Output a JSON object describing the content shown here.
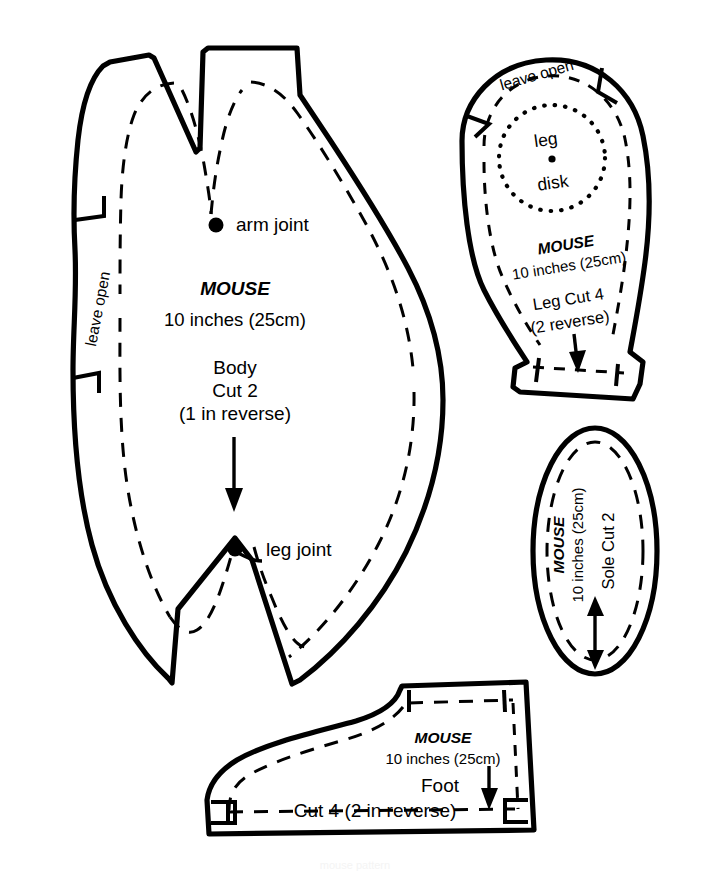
{
  "document": {
    "title": "MOUSE sewing pattern sheet",
    "brand": "MOUSE",
    "size": "10 inches (25cm)",
    "watermark": "mouse pattern"
  },
  "pieces": [
    {
      "id": "body",
      "name": "Body",
      "brand": "MOUSE",
      "size": "10 inches (25cm)",
      "piece_label": "Body",
      "cut_line_1": "Cut 2",
      "cut_line_2": "(1 in reverse)",
      "leave_open": "leave open",
      "marks": [
        {
          "name": "arm joint",
          "label": "arm joint"
        },
        {
          "name": "leg joint",
          "label": "leg joint"
        }
      ],
      "grainline": "down-arrow"
    },
    {
      "id": "leg",
      "name": "Leg",
      "brand": "MOUSE",
      "size": "10 inches (25cm)",
      "piece_label": "Leg Cut 4",
      "cut_line_1": "(2 reverse)",
      "leave_open": "leave open",
      "disk_line_1": "leg",
      "disk_line_2": "disk",
      "grainline": "down-arrow"
    },
    {
      "id": "sole",
      "name": "Sole",
      "brand": "MOUSE",
      "size": "10 inches (25cm)",
      "piece_label": "Sole Cut 2",
      "grainline": "double-arrow"
    },
    {
      "id": "foot",
      "name": "Foot",
      "brand": "MOUSE",
      "size": "10 inches (25cm)",
      "piece_label": "Foot",
      "cut_line_1": "Cut 4 (2 in reverse)",
      "grainline": "down-arrow"
    }
  ],
  "colors": {
    "ink": "#000000",
    "paper": "#ffffff"
  }
}
